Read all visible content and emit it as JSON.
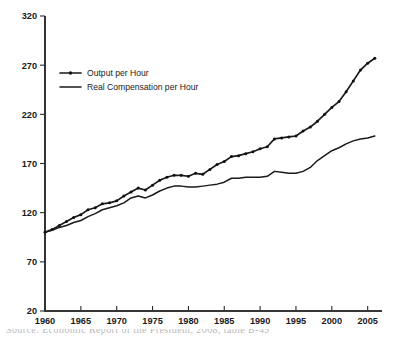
{
  "figure": {
    "background_color": "#ffffff",
    "ink_color": "#1a1a1a",
    "partial_caption": "Source: Economic Report of the President, 2008, table B-49"
  },
  "legend": {
    "position": "upper-left-inside",
    "entries": [
      {
        "label": "Output per Hour",
        "marker": "dot",
        "style": "line-with-markers"
      },
      {
        "label": "Real Compensation per Hour",
        "marker": "none",
        "style": "plain-line"
      }
    ]
  },
  "axes": {
    "y_ticks": [
      "20",
      "70",
      "120",
      "170",
      "220",
      "270",
      "320"
    ],
    "x_ticks": [
      "1960",
      "1965",
      "1970",
      "1975",
      "1980",
      "1985",
      "1990",
      "1995",
      "2000",
      "2005"
    ]
  },
  "chart_data": {
    "type": "line",
    "title": "",
    "subtitle": "",
    "xlabel": "",
    "ylabel": "",
    "xlim": [
      1960,
      2007
    ],
    "ylim": [
      20,
      320
    ],
    "grid": false,
    "legend_position": "upper left",
    "x_tick_values": [
      1960,
      1965,
      1970,
      1975,
      1980,
      1985,
      1990,
      1995,
      2000,
      2005
    ],
    "y_tick_values": [
      20,
      70,
      120,
      170,
      220,
      270,
      320
    ],
    "x": [
      1960,
      1961,
      1962,
      1963,
      1964,
      1965,
      1966,
      1967,
      1968,
      1969,
      1970,
      1971,
      1972,
      1973,
      1974,
      1975,
      1976,
      1977,
      1978,
      1979,
      1980,
      1981,
      1982,
      1983,
      1984,
      1985,
      1986,
      1987,
      1988,
      1989,
      1990,
      1991,
      1992,
      1993,
      1994,
      1995,
      1996,
      1997,
      1998,
      1999,
      2000,
      2001,
      2002,
      2003,
      2004,
      2005,
      2006
    ],
    "series": [
      {
        "name": "Output per Hour",
        "marker": "dot",
        "values": [
          100,
          103,
          107,
          111,
          115,
          118,
          123,
          125,
          129,
          130,
          132,
          137,
          141,
          145,
          143,
          148,
          153,
          156,
          158,
          158,
          157,
          160,
          159,
          164,
          169,
          172,
          177,
          178,
          180,
          182,
          185,
          187,
          195,
          196,
          197,
          198,
          203,
          207,
          213,
          220,
          227,
          233,
          243,
          254,
          265,
          272,
          277
        ]
      },
      {
        "name": "Real Compensation per Hour",
        "marker": "none",
        "values": [
          100,
          102,
          105,
          107,
          110,
          112,
          116,
          119,
          123,
          125,
          127,
          130,
          135,
          137,
          135,
          138,
          142,
          145,
          147,
          147,
          146,
          146,
          147,
          148,
          149,
          151,
          155,
          155,
          156,
          156,
          156,
          157,
          162,
          161,
          160,
          160,
          162,
          166,
          173,
          178,
          183,
          186,
          190,
          193,
          195,
          196,
          198
        ]
      }
    ]
  }
}
